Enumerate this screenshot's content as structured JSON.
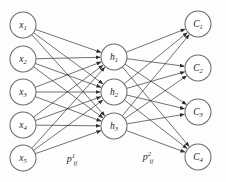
{
  "figure": {
    "name": "three-layer-neural-network-diagram",
    "background_color": "#fdfdfd",
    "width": 226,
    "height": 182
  },
  "style": {
    "node_fill": "#ffffff",
    "node_stroke": "#6b6b6b",
    "edge_color": "#3a3a3a",
    "text_color": "#1a1a1a",
    "node_radius": 13
  },
  "layers": {
    "input": {
      "name": "input-layer",
      "cx": 23,
      "nodes": [
        {
          "id": "x1",
          "base": "x",
          "sub": "1",
          "cy": 25
        },
        {
          "id": "x2",
          "base": "x",
          "sub": "2",
          "cy": 59
        },
        {
          "id": "x3",
          "base": "x",
          "sub": "3",
          "cy": 92
        },
        {
          "id": "x4",
          "base": "x",
          "sub": "4",
          "cy": 125
        },
        {
          "id": "x5",
          "base": "x",
          "sub": "5",
          "cy": 158
        }
      ]
    },
    "hidden": {
      "name": "hidden-layer",
      "cx": 114,
      "nodes": [
        {
          "id": "h1",
          "base": "h",
          "sub": "1",
          "cy": 57
        },
        {
          "id": "h2",
          "base": "h",
          "sub": "2",
          "cy": 92
        },
        {
          "id": "h3",
          "base": "h",
          "sub": "3",
          "cy": 126
        }
      ]
    },
    "output": {
      "name": "output-layer",
      "cx": 198,
      "nodes": [
        {
          "id": "C1",
          "base": "C",
          "sub": "1",
          "cy": 24
        },
        {
          "id": "C2",
          "base": "C",
          "sub": "2",
          "cy": 68
        },
        {
          "id": "C3",
          "base": "C",
          "sub": "3",
          "cy": 112
        },
        {
          "id": "C4",
          "base": "C",
          "sub": "4",
          "cy": 157
        }
      ]
    }
  },
  "weight_labels": [
    {
      "id": "p1ij",
      "name": "input-hidden-weight-label",
      "base": "p",
      "sup": "1",
      "sub": "ij",
      "x": 72,
      "y": 162
    },
    {
      "id": "p2ij",
      "name": "hidden-output-weight-label",
      "base": "p",
      "sup": "2",
      "sub": "ij",
      "x": 148,
      "y": 160
    }
  ],
  "connections": {
    "input_to_hidden_description": "fully connected, 5 x 3 = 15 directed edges with arrowheads into hidden nodes",
    "hidden_to_output_description": "fully connected, 3 x 4 = 12 directed edges with arrowheads into output nodes"
  }
}
